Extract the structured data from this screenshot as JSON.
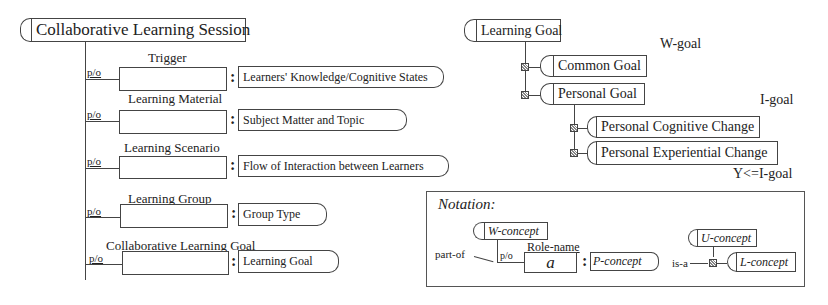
{
  "session": {
    "title": "Collaborative Learning Session",
    "part_of_label": "p/o",
    "slots": [
      {
        "role": "Trigger",
        "concept": "Learners' Knowledge/Cognitive States"
      },
      {
        "role": "Learning Material",
        "concept": "Subject Matter and Topic"
      },
      {
        "role": "Learning Scenario",
        "concept": "Flow of Interaction between Learners"
      },
      {
        "role": "Learning Group",
        "concept": "Group Type"
      },
      {
        "role": "Collaborative Learning Goal",
        "concept": "Learning Goal"
      }
    ]
  },
  "goals": {
    "root": "Learning Goal",
    "w_goal_label": "W-goal",
    "common": "Common Goal",
    "personal": "Personal Goal",
    "i_goal_label": "I-goal",
    "cognitive": "Personal Cognitive Change",
    "experiential": "Personal Experiential Change",
    "y_label": "Y<=I-goal"
  },
  "notation": {
    "title": "Notation:",
    "w_concept": "W-concept",
    "part_of": "part-of",
    "p_o": "p/o",
    "role_name": "Role-name",
    "a": "a",
    "p_concept": "P-concept",
    "u_concept": "U-concept",
    "is_a": "is-a",
    "l_concept": "L-concept"
  }
}
